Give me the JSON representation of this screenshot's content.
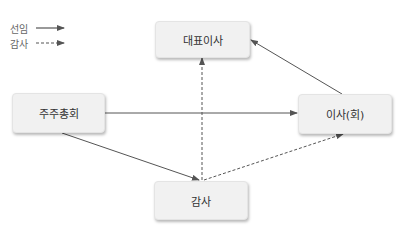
{
  "legend": {
    "items": [
      {
        "label": "선임",
        "style": "solid"
      },
      {
        "label": "감사",
        "style": "dashed"
      }
    ]
  },
  "nodes": {
    "ceo": {
      "label": "대표이사"
    },
    "shareholders": {
      "label": "주주총회"
    },
    "board": {
      "label": "이사(회)"
    },
    "auditor": {
      "label": "감사"
    }
  },
  "edges": [
    {
      "from": "주주총회",
      "to": "이사(회)",
      "type": "선임",
      "style": "solid"
    },
    {
      "from": "주주총회",
      "to": "감사",
      "type": "선임",
      "style": "solid"
    },
    {
      "from": "이사(회)",
      "to": "대표이사",
      "type": "선임",
      "style": "solid"
    },
    {
      "from": "감사",
      "to": "대표이사",
      "type": "감사",
      "style": "dashed"
    },
    {
      "from": "감사",
      "to": "이사(회)",
      "type": "감사",
      "style": "dashed"
    }
  ],
  "colors": {
    "arrow": "#555555",
    "node_bg": "#f1f1f1",
    "text": "#333333"
  }
}
